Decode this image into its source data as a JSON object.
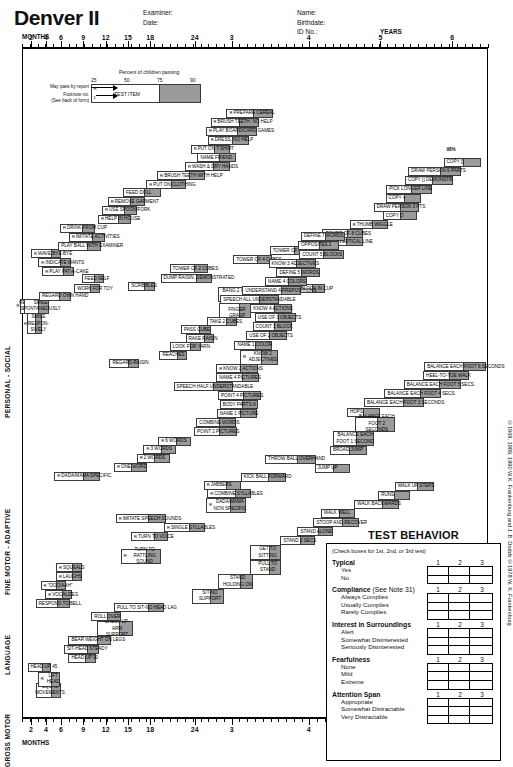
{
  "header": {
    "title": "Denver II",
    "examiner_block": "Examiner:\nDate:",
    "name_block": "Name:\nBirthdate:\nID No.:"
  },
  "axis": {
    "unit_months": "MONTHS",
    "unit_years": "YEARS",
    "labels": [
      "2",
      "4",
      "6",
      "9",
      "12",
      "15",
      "18",
      "24",
      "3",
      "4",
      "5",
      "6"
    ],
    "positions": [
      5.0,
      13.4,
      21.8,
      34.2,
      46.7,
      59.1,
      71.5,
      96.4,
      117.0,
      160.0,
      200.0,
      240.0
    ]
  },
  "legend": {
    "percent_title": "Percent of children passing",
    "percent_marks": [
      "25",
      "50",
      "75",
      "90"
    ],
    "test_item_label": "TEST ITEM",
    "may_pass_note": "May pass by report",
    "footnote_note": "Footnote no.\n(See back of form)",
    "marker_report": "R",
    "marker_footnote": "1"
  },
  "pct98": "98%",
  "domains": [
    {
      "label": "PERSONAL - SOCIAL"
    },
    {
      "label": "FINE MOTOR - ADAPTIVE"
    },
    {
      "label": "LANGUAGE"
    },
    {
      "label": "GROSS MOTOR"
    }
  ],
  "items": {
    "personal_social": [
      {
        "text": "REGARD FACE",
        "mk": "",
        "x": -6,
        "y": 276,
        "w": 26,
        "fill": 14,
        "lines": 2
      },
      {
        "text": "SMILE RESPON-SIVELY",
        "mk": "R",
        "x": 7,
        "y": 292,
        "w": 26,
        "fill": 9,
        "lines": 3
      },
      {
        "text": "SMILE SPONTANEOUSLY",
        "mk": "R",
        "x": 2,
        "y": 276,
        "w": 44,
        "fill": 16,
        "lines": 2
      },
      {
        "text": "REGARD OWN HAND",
        "mk": "",
        "x": 28,
        "y": 268,
        "w": 56,
        "fill": 17
      },
      {
        "text": "WORK FOR TOY",
        "mk": "",
        "x": 90,
        "y": 260,
        "w": 45,
        "fill": 13
      },
      {
        "text": "FEED SELF",
        "mk": "",
        "x": 103,
        "y": 249,
        "w": 40,
        "fill": 14
      },
      {
        "text": "PLAY PAT-A-CAKE",
        "mk": "R",
        "x": 34,
        "y": 241,
        "w": 55,
        "fill": 15
      },
      {
        "text": "INDICATE WANTS",
        "mk": "R",
        "x": 27,
        "y": 231,
        "w": 57,
        "fill": 16
      },
      {
        "text": "WAVE BYE-BYE",
        "mk": "R",
        "x": 14,
        "y": 221,
        "w": 53,
        "fill": 15
      },
      {
        "text": "PLAY BALL WITH EXAMINER",
        "mk": "",
        "x": 62,
        "y": 213,
        "w": 76,
        "fill": 22
      },
      {
        "text": "IMITATE ACTIVITIES",
        "mk": "R",
        "x": 81,
        "y": 203,
        "w": 64,
        "fill": 20
      },
      {
        "text": "DRINK FROM CUP",
        "mk": "R",
        "x": 65,
        "y": 193,
        "w": 62,
        "fill": 19
      },
      {
        "text": "HELP IN HOUSE",
        "mk": "R",
        "x": 132,
        "y": 183,
        "w": 58,
        "fill": 20
      },
      {
        "text": "USE SPOON/FORK",
        "mk": "R",
        "x": 139,
        "y": 173,
        "w": 62,
        "fill": 20
      },
      {
        "text": "REMOVE GARMENT",
        "mk": "R",
        "x": 149,
        "y": 164,
        "w": 65,
        "fill": 22
      },
      {
        "text": "FEED DOLL",
        "mk": "",
        "x": 176,
        "y": 154,
        "w": 67,
        "fill": 26
      },
      {
        "text": "PUT ON CLOTHING",
        "mk": "R",
        "x": 217,
        "y": 145,
        "w": 70,
        "fill": 23
      },
      {
        "text": "BRUSH TEETH WITH HELP",
        "mk": "R",
        "x": 236,
        "y": 135,
        "w": 85,
        "fill": 26
      },
      {
        "text": "WASH & DRY HANDS",
        "mk": "R",
        "x": 285,
        "y": 125,
        "w": 79,
        "fill": 27
      },
      {
        "text": "NAME FRIEND",
        "mk": "",
        "x": 307,
        "y": 115,
        "w": 67,
        "fill": 25
      },
      {
        "text": "PUT ON T-SHIRT",
        "mk": "R",
        "x": 295,
        "y": 106,
        "w": 70,
        "fill": 25
      },
      {
        "text": "DRESS, NO HELP",
        "mk": "R",
        "x": 325,
        "y": 96,
        "w": 72,
        "fill": 25
      },
      {
        "text": "PLAY BOARD/CARD GAMES",
        "mk": "R",
        "x": 322,
        "y": 86,
        "w": 90,
        "fill": 32
      },
      {
        "text": "BRUSH TEETH, NO HELP",
        "mk": "R",
        "x": 330,
        "y": 76,
        "w": 86,
        "fill": 32
      },
      {
        "text": "PREPARE CEREAL",
        "mk": "R",
        "x": 358,
        "y": 66,
        "w": 82,
        "fill": 32
      }
    ],
    "fine_motor": [
      {
        "text": "EQUAL MOVEMENTS",
        "mk": "",
        "x": 22,
        "y": 700,
        "w": 44,
        "fill": 13,
        "lines": 2
      },
      {
        "text": "REGARD RAISIN",
        "mk": "",
        "x": 152,
        "y": 342,
        "w": 52,
        "fill": 16
      },
      {
        "text": "REACHES",
        "mk": "",
        "x": 240,
        "y": 333,
        "w": 48,
        "fill": 14
      },
      {
        "text": "LOOK FOR YARN",
        "mk": "",
        "x": 258,
        "y": 324,
        "w": 56,
        "fill": 16
      },
      {
        "text": "RAKE RAISIN",
        "mk": "",
        "x": 286,
        "y": 315,
        "w": 50,
        "fill": 14
      },
      {
        "text": "PASS CUBE",
        "mk": "",
        "x": 278,
        "y": 305,
        "w": 52,
        "fill": 16
      },
      {
        "text": "TAKE 2 CUBES",
        "mk": "",
        "x": 323,
        "y": 296,
        "w": 54,
        "fill": 16
      },
      {
        "text": "THUMB-FINGER GRASP",
        "mk": "",
        "x": 345,
        "y": 280,
        "w": 56,
        "fill": 18,
        "lines": 2
      },
      {
        "text": "BANG 2 CUBES HELD IN HANDS",
        "mk": "",
        "x": 344,
        "y": 263,
        "w": 67,
        "fill": 18,
        "lines": 2
      },
      {
        "text": "PUT BLOCK IN CUP",
        "mk": "",
        "x": 465,
        "y": 260,
        "w": 66,
        "fill": 19
      },
      {
        "text": "SCRIBBLES",
        "mk": "",
        "x": 185,
        "y": 257,
        "w": 47,
        "fill": 16
      },
      {
        "text": "DUMP RAISIN, DEMONSTRATED",
        "mk": "",
        "x": 242,
        "y": 248,
        "w": 91,
        "fill": 25
      },
      {
        "text": "TOWER OF 2 CUBES",
        "mk": "",
        "x": 258,
        "y": 238,
        "w": 68,
        "fill": 22
      },
      {
        "text": "TOWER OF 4 CUBES",
        "mk": "",
        "x": 370,
        "y": 228,
        "w": 68,
        "fill": 22
      },
      {
        "text": "TOWER OF 6 CUBES",
        "mk": "",
        "x": 434,
        "y": 218,
        "w": 70,
        "fill": 24
      },
      {
        "text": "IMITATE VERTICAL LINE",
        "mk": "",
        "x": 518,
        "y": 208,
        "w": 80,
        "fill": 26
      },
      {
        "text": "TOWER OF 8 CUBES",
        "mk": "",
        "x": 527,
        "y": 199,
        "w": 72,
        "fill": 26
      },
      {
        "text": "THUMB WIGGLE",
        "mk": "R",
        "x": 575,
        "y": 189,
        "w": 68,
        "fill": 26
      },
      {
        "text": "COPY O",
        "mk": "",
        "x": 633,
        "y": 179,
        "w": 60,
        "fill": 26
      },
      {
        "text": "DRAW PERSON 3 PTS",
        "mk": "",
        "x": 617,
        "y": 170,
        "w": 80,
        "fill": 30
      },
      {
        "text": "COPY +",
        "mk": "",
        "x": 638,
        "y": 160,
        "w": 62,
        "fill": 26
      },
      {
        "text": "PICK LONGER LINE",
        "mk": "",
        "x": 639,
        "y": 150,
        "w": 80,
        "fill": 33
      },
      {
        "text": "COPY [] DEMONSTR.",
        "mk": "",
        "x": 672,
        "y": 140,
        "w": 84,
        "fill": 32
      },
      {
        "text": "DRAW PERSON 6 PARTS",
        "mk": "",
        "x": 678,
        "y": 130,
        "w": 92,
        "fill": 33
      },
      {
        "text": "COPY []",
        "mk": "",
        "x": 740,
        "y": 120,
        "w": 66,
        "fill": 28
      }
    ],
    "language": [
      {
        "text": "RESPOND TO BELL",
        "mk": "",
        "x": 22,
        "y": 608,
        "w": 60,
        "fill": 18
      },
      {
        "text": "VOCALIZES",
        "mk": "R",
        "x": 39,
        "y": 598,
        "w": 47,
        "fill": 14
      },
      {
        "text": "\"OOO/AAH\"",
        "mk": "R",
        "x": 31,
        "y": 588,
        "w": 45,
        "fill": 14
      },
      {
        "text": "LAUGHS",
        "mk": "R",
        "x": 58,
        "y": 578,
        "w": 45,
        "fill": 14
      },
      {
        "text": "SQUEALS",
        "mk": "R",
        "x": 58,
        "y": 568,
        "w": 45,
        "fill": 14
      },
      {
        "text": "TURN TO RATTLING SOUND",
        "mk": "R",
        "x": 172,
        "y": 552,
        "w": 70,
        "fill": 22,
        "lines": 2
      },
      {
        "text": "TURN TO VOICE",
        "mk": "R",
        "x": 190,
        "y": 534,
        "w": 66,
        "fill": 22
      },
      {
        "text": "SINGLE SYLLABLES",
        "mk": "R",
        "x": 248,
        "y": 524,
        "w": 72,
        "fill": 24
      },
      {
        "text": "IMITATE SPEECH SOUNDS",
        "mk": "R",
        "x": 163,
        "y": 514,
        "w": 88,
        "fill": 28
      },
      {
        "text": "DADA/MAMA NON SPECIFIC",
        "mk": "R",
        "x": 322,
        "y": 496,
        "w": 70,
        "fill": 24,
        "lines": 2
      },
      {
        "text": "COMBINE SYLLABLES",
        "mk": "R",
        "x": 324,
        "y": 486,
        "w": 78,
        "fill": 26
      },
      {
        "text": "JABBERS",
        "mk": "R",
        "x": 318,
        "y": 477,
        "w": 66,
        "fill": 24
      },
      {
        "text": "DADA/MAMA SPECIFIC",
        "mk": "R",
        "x": 55,
        "y": 467,
        "w": 80,
        "fill": 26
      },
      {
        "text": "ONE WORD",
        "mk": "R",
        "x": 160,
        "y": 457,
        "w": 58,
        "fill": 24
      },
      {
        "text": "2 WORDS",
        "mk": "R",
        "x": 200,
        "y": 447,
        "w": 58,
        "fill": 24
      },
      {
        "text": "3 WORDS",
        "mk": "R",
        "x": 212,
        "y": 437,
        "w": 58,
        "fill": 24
      },
      {
        "text": "6 WORDS",
        "mk": "R",
        "x": 238,
        "y": 428,
        "w": 58,
        "fill": 24
      },
      {
        "text": "POINT 2 PICTURES",
        "mk": "",
        "x": 301,
        "y": 418,
        "w": 76,
        "fill": 28
      },
      {
        "text": "COMBINE WORDS",
        "mk": "",
        "x": 305,
        "y": 408,
        "w": 70,
        "fill": 26
      },
      {
        "text": "NAME 1 PICTURE",
        "mk": "",
        "x": 341,
        "y": 398,
        "w": 70,
        "fill": 26
      },
      {
        "text": "BODY PARTS-6",
        "mk": "",
        "x": 346,
        "y": 388,
        "w": 68,
        "fill": 26
      },
      {
        "text": "POINT 4 PICTURES",
        "mk": "",
        "x": 343,
        "y": 378,
        "w": 76,
        "fill": 28
      },
      {
        "text": "SPEECH HALF UNDERSTANDABLE",
        "mk": "",
        "x": 265,
        "y": 368,
        "w": 104,
        "fill": 32
      },
      {
        "text": "NAME 4 PICTURES",
        "mk": "",
        "x": 340,
        "y": 358,
        "w": 76,
        "fill": 28
      },
      {
        "text": "KNOW 2 ACTIONS",
        "mk": "R",
        "x": 340,
        "y": 348,
        "w": 74,
        "fill": 28
      },
      {
        "text": "KNOW 2 ADJECTIVES",
        "mk": "R",
        "x": 382,
        "y": 332,
        "w": 66,
        "fill": 26,
        "lines": 2
      },
      {
        "text": "NAME 1 COLOR",
        "mk": "",
        "x": 372,
        "y": 322,
        "w": 66,
        "fill": 26
      },
      {
        "text": "USE OF 2 OBJECTS",
        "mk": "",
        "x": 393,
        "y": 312,
        "w": 72,
        "fill": 28
      },
      {
        "text": "COUNT 1 BLOCK",
        "mk": "",
        "x": 404,
        "y": 302,
        "w": 70,
        "fill": 28
      },
      {
        "text": "USE OF 3 OBJECTS",
        "mk": "",
        "x": 408,
        "y": 292,
        "w": 72,
        "fill": 28
      },
      {
        "text": "KNOW 4 ACTIONS",
        "mk": "",
        "x": 400,
        "y": 282,
        "w": 74,
        "fill": 28
      },
      {
        "text": "SPEECH ALL UNDERSTANDABLE",
        "mk": "",
        "x": 347,
        "y": 272,
        "w": 104,
        "fill": 32
      },
      {
        "text": "UNDERSTAND 4 PREPOSITIONS",
        "mk": "",
        "x": 386,
        "y": 262,
        "w": 104,
        "fill": 32
      },
      {
        "text": "NAME 4 COLORS",
        "mk": "",
        "x": 426,
        "y": 252,
        "w": 74,
        "fill": 30
      },
      {
        "text": "DEFINE 5 WORDS",
        "mk": "",
        "x": 446,
        "y": 242,
        "w": 76,
        "fill": 30
      },
      {
        "text": "KNOW 3 ADJECTIVES",
        "mk": "",
        "x": 432,
        "y": 232,
        "w": 84,
        "fill": 32
      },
      {
        "text": "COUNT 5 BLOCKS",
        "mk": "",
        "x": 486,
        "y": 222,
        "w": 78,
        "fill": 32
      },
      {
        "text": "OPPOSITES 2",
        "mk": "",
        "x": 484,
        "y": 212,
        "w": 72,
        "fill": 32
      },
      {
        "text": "DEFINE 7 WORDS",
        "mk": "",
        "x": 489,
        "y": 202,
        "w": 78,
        "fill": 32
      }
    ],
    "gross_motor": [
      {
        "text": "LIFT HEAD",
        "mk": "R",
        "x": 26,
        "y": 688,
        "w": 40,
        "fill": 13,
        "lines": 2
      },
      {
        "text": "HEAD UP 45",
        "mk": "",
        "x": 8,
        "y": 678,
        "w": 42,
        "fill": 13
      },
      {
        "text": "HEAD UP 90",
        "mk": "",
        "x": 80,
        "y": 668,
        "w": 48,
        "fill": 16
      },
      {
        "text": "SIT-HEAD STEADY",
        "mk": "",
        "x": 72,
        "y": 658,
        "w": 62,
        "fill": 18
      },
      {
        "text": "BEAR WEIGHT ON LEGS",
        "mk": "",
        "x": 80,
        "y": 648,
        "w": 75,
        "fill": 22
      },
      {
        "text": "CHEST UP-ARM SUPPORT",
        "mk": "",
        "x": 131,
        "y": 632,
        "w": 62,
        "fill": 20,
        "lines": 2
      },
      {
        "text": "ROLL OVER",
        "mk": "",
        "x": 120,
        "y": 622,
        "w": 52,
        "fill": 20
      },
      {
        "text": "PULL TO SIT-NO HEAD LAG",
        "mk": "",
        "x": 160,
        "y": 612,
        "w": 88,
        "fill": 24
      },
      {
        "text": "SIT-NO SUPPORT",
        "mk": "",
        "x": 298,
        "y": 596,
        "w": 55,
        "fill": 20,
        "lines": 2
      },
      {
        "text": "STAND HOLDING ON",
        "mk": "",
        "x": 343,
        "y": 580,
        "w": 62,
        "fill": 20,
        "lines": 2
      },
      {
        "text": "PULL TO STAND",
        "mk": "",
        "x": 400,
        "y": 564,
        "w": 54,
        "fill": 18,
        "lines": 2
      },
      {
        "text": "GET TO SITTING",
        "mk": "",
        "x": 400,
        "y": 548,
        "w": 54,
        "fill": 18,
        "lines": 2
      },
      {
        "text": "STAND 2 SECS",
        "mk": "",
        "x": 453,
        "y": 538,
        "w": 60,
        "fill": 22
      },
      {
        "text": "STAND ALONE",
        "mk": "",
        "x": 483,
        "y": 528,
        "w": 62,
        "fill": 22
      },
      {
        "text": "STOOP AND RECOVER",
        "mk": "",
        "x": 511,
        "y": 518,
        "w": 80,
        "fill": 26
      },
      {
        "text": "WALK WELL",
        "mk": "",
        "x": 524,
        "y": 508,
        "w": 60,
        "fill": 24
      },
      {
        "text": "WALK BACKWARDS",
        "mk": "",
        "x": 583,
        "y": 498,
        "w": 78,
        "fill": 26
      },
      {
        "text": "RUNS",
        "mk": "",
        "x": 625,
        "y": 488,
        "w": 56,
        "fill": 24
      },
      {
        "text": "WALK UP STEPS",
        "mk": "",
        "x": 654,
        "y": 478,
        "w": 70,
        "fill": 28
      },
      {
        "text": "KICK BALL FORWARD",
        "mk": "",
        "x": 383,
        "y": 468,
        "w": 80,
        "fill": 28
      },
      {
        "text": "JUMP UP",
        "mk": "",
        "x": 513,
        "y": 458,
        "w": 62,
        "fill": 26
      },
      {
        "text": "THROW BALL OVERHAND",
        "mk": "",
        "x": 426,
        "y": 448,
        "w": 90,
        "fill": 30
      },
      {
        "text": "BROAD JUMP",
        "mk": "",
        "x": 540,
        "y": 438,
        "w": 66,
        "fill": 28
      },
      {
        "text": "BALANCE EACH FOOT 1 SECOND",
        "mk": "",
        "x": 545,
        "y": 422,
        "w": 72,
        "fill": 28,
        "lines": 2
      },
      {
        "text": "HOPS",
        "mk": "",
        "x": 570,
        "y": 396,
        "w": 58,
        "fill": 26
      },
      {
        "text": "BALANCE EACH FOOT 2 SECONDS",
        "mk": "",
        "x": 584,
        "y": 406,
        "w": 70,
        "fill": 28,
        "lines": 2
      },
      {
        "text": "BALANCE EACH FOOT 3 SECONDS",
        "mk": "",
        "x": 600,
        "y": 386,
        "w": 106,
        "fill": 34
      },
      {
        "text": "BALANCE EACH FOOT 4 SECS.",
        "mk": "",
        "x": 636,
        "y": 376,
        "w": 100,
        "fill": 34
      },
      {
        "text": "BALANCE EACH FOOT 5 SECS.",
        "mk": "",
        "x": 670,
        "y": 366,
        "w": 100,
        "fill": 34
      },
      {
        "text": "HEEL-TO-TOE WALK",
        "mk": "",
        "x": 704,
        "y": 356,
        "w": 80,
        "fill": 30
      },
      {
        "text": "BALANCE EACH FOOT 6 SECONDS",
        "mk": "",
        "x": 706,
        "y": 346,
        "w": 108,
        "fill": 36
      }
    ]
  },
  "test_behavior": {
    "title": "TEST BEHAVIOR",
    "note": "(Check boxes for 1st, 2nd, or 3rd test)",
    "column_numbers": [
      "1",
      "2",
      "3"
    ],
    "groups": [
      {
        "heading": "Typical",
        "sub": "",
        "options": [
          "Yes",
          "No"
        ]
      },
      {
        "heading": "Compliance",
        "sub": " (See Note 31)",
        "options": [
          "Always Complies",
          "Usually Complies",
          "Rarely Complies"
        ]
      },
      {
        "heading": "Interest in Surroundings",
        "sub": "",
        "options": [
          "Alert",
          "Somewhat Disinterested",
          "Seriously Disinterested"
        ]
      },
      {
        "heading": "Fearfulness",
        "sub": "",
        "options": [
          "None",
          "Mild",
          "Extreme"
        ]
      },
      {
        "heading": "Attention Span",
        "sub": "",
        "options": [
          "Appropriate",
          "Somewhat Distractable",
          "Very Distractable"
        ]
      }
    ]
  },
  "copyright": "©1969, 1989, 1990 W.K. Frankenburg and J. B. Dodds  ©1978 W. K. Frankenburg"
}
